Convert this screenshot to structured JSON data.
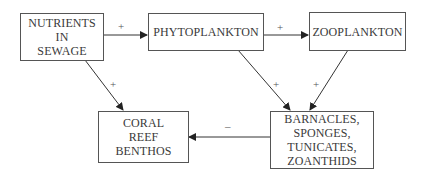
{
  "diagram": {
    "nodes": [
      {
        "id": "nutrients",
        "lines": [
          "NUTRIENTS",
          "IN",
          "SEWAGE"
        ]
      },
      {
        "id": "phytoplankton",
        "lines": [
          "PHYTOPLANKTON"
        ]
      },
      {
        "id": "zooplankton",
        "lines": [
          "ZOOPLANKTON"
        ]
      },
      {
        "id": "coral",
        "lines": [
          "CORAL",
          "REEF",
          "BENTHOS"
        ]
      },
      {
        "id": "barnacles",
        "lines": [
          "BARNACLES,",
          "SPONGES,",
          "TUNICATES,",
          "ZOANTHIDS"
        ]
      }
    ],
    "edges": [
      {
        "from": "nutrients",
        "to": "phytoplankton",
        "sign": "+"
      },
      {
        "from": "phytoplankton",
        "to": "zooplankton",
        "sign": "+"
      },
      {
        "from": "nutrients",
        "to": "coral",
        "sign": "+"
      },
      {
        "from": "phytoplankton",
        "to": "barnacles",
        "sign": "+"
      },
      {
        "from": "zooplankton",
        "to": "barnacles",
        "sign": "+"
      },
      {
        "from": "barnacles",
        "to": "coral",
        "sign": "–"
      }
    ]
  }
}
